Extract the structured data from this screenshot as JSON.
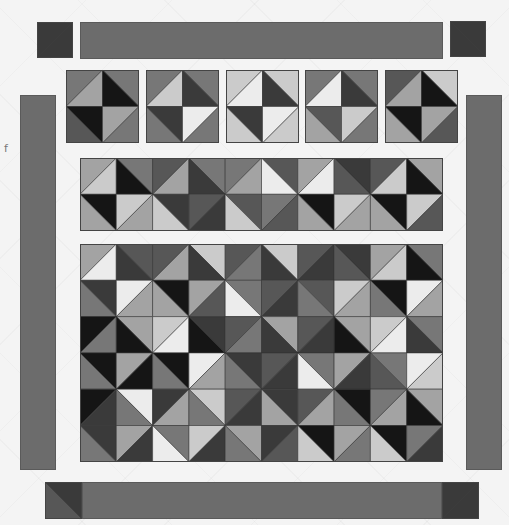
{
  "fragment_text": "f",
  "palette": [
    "#151515",
    "#3a3a3a",
    "#575757",
    "#777777",
    "#a3a3a3",
    "#cbcbcb",
    "#ececec"
  ],
  "border_color": "#6c6c6c",
  "corners": {
    "top_left": {
      "x": 37,
      "y": 22,
      "size": 36,
      "diag": "/",
      "a": 1,
      "b": 1
    },
    "top_right": {
      "x": 450,
      "y": 21,
      "size": 36,
      "diag": "\\",
      "a": 1,
      "b": 1
    },
    "bottom_left": {
      "x": 45,
      "y": 482,
      "size": 37,
      "diag": "\\",
      "a": 1,
      "b": 2
    },
    "bottom_right": {
      "x": 442,
      "y": 482,
      "size": 37,
      "diag": "/",
      "a": 1,
      "b": 1
    }
  },
  "borders": {
    "top": {
      "x": 80,
      "y": 22,
      "w": 363,
      "h": 37
    },
    "bottom": {
      "x": 82,
      "y": 482,
      "w": 360,
      "h": 37
    },
    "left": {
      "x": 20,
      "y": 95,
      "w": 36,
      "h": 375
    },
    "right": {
      "x": 466,
      "y": 95,
      "w": 36,
      "h": 375
    }
  },
  "top_blocks": {
    "y": 70,
    "size": 73,
    "xs": [
      66,
      146,
      226,
      305,
      385
    ],
    "blocks": [
      [
        [
          [
            "/",
            3,
            4
          ],
          [
            "\\",
            3,
            0
          ]
        ],
        [
          [
            "\\",
            0,
            2
          ],
          [
            "/",
            4,
            3
          ]
        ]
      ],
      [
        [
          [
            "/",
            3,
            5
          ],
          [
            "\\",
            3,
            1
          ]
        ],
        [
          [
            "\\",
            1,
            3
          ],
          [
            "/",
            6,
            3
          ]
        ]
      ],
      [
        [
          [
            "/",
            5,
            6
          ],
          [
            "\\",
            5,
            1
          ]
        ],
        [
          [
            "\\",
            1,
            5
          ],
          [
            "/",
            6,
            5
          ]
        ]
      ],
      [
        [
          [
            "/",
            3,
            6
          ],
          [
            "\\",
            3,
            1
          ]
        ],
        [
          [
            "\\",
            2,
            4
          ],
          [
            "/",
            5,
            3
          ]
        ]
      ],
      [
        [
          [
            "/",
            2,
            4
          ],
          [
            "\\",
            5,
            0
          ]
        ],
        [
          [
            "\\",
            0,
            4
          ],
          [
            "/",
            4,
            2
          ]
        ]
      ]
    ]
  },
  "middle_strip": {
    "x": 80,
    "y": 158,
    "cell": 36.3,
    "cols": 10,
    "rows": 2,
    "cells": [
      [
        [
          "/",
          4,
          5
        ],
        [
          "\\",
          3,
          0
        ],
        [
          "/",
          2,
          4
        ],
        [
          "\\",
          3,
          1
        ],
        [
          "/",
          3,
          4
        ],
        [
          "\\",
          2,
          6
        ],
        [
          "/",
          4,
          6
        ],
        [
          "\\",
          1,
          2
        ],
        [
          "/",
          2,
          5
        ],
        [
          "\\",
          4,
          0
        ]
      ],
      [
        [
          "\\",
          0,
          4
        ],
        [
          "/",
          5,
          4
        ],
        [
          "\\",
          1,
          5
        ],
        [
          "/",
          2,
          1
        ],
        [
          "\\",
          2,
          5
        ],
        [
          "/",
          3,
          2
        ],
        [
          "\\",
          0,
          4
        ],
        [
          "/",
          5,
          4
        ],
        [
          "\\",
          0,
          4
        ],
        [
          "/",
          5,
          2
        ]
      ]
    ]
  },
  "main_grid": {
    "x": 80,
    "y": 244,
    "cell": 36.3,
    "cols": 10,
    "rows": 6,
    "cells": [
      [
        [
          "/",
          4,
          6
        ],
        [
          "\\",
          2,
          1
        ],
        [
          "/",
          2,
          4
        ],
        [
          "\\",
          5,
          1
        ],
        [
          "/",
          2,
          3
        ],
        [
          "\\",
          5,
          1
        ],
        [
          "/",
          2,
          1
        ],
        [
          "\\",
          1,
          2
        ],
        [
          "/",
          4,
          5
        ],
        [
          "\\",
          3,
          0
        ]
      ],
      [
        [
          "\\",
          1,
          3
        ],
        [
          "/",
          6,
          4
        ],
        [
          "\\",
          0,
          4
        ],
        [
          "/",
          4,
          2
        ],
        [
          "\\",
          3,
          6
        ],
        [
          "/",
          2,
          1
        ],
        [
          "\\",
          2,
          3
        ],
        [
          "/",
          5,
          4
        ],
        [
          "\\",
          0,
          3
        ],
        [
          "/",
          6,
          4
        ]
      ],
      [
        [
          "/",
          0,
          3
        ],
        [
          "\\",
          4,
          0
        ],
        [
          "/",
          5,
          6
        ],
        [
          "\\",
          1,
          0
        ],
        [
          "/",
          2,
          3
        ],
        [
          "\\",
          4,
          1
        ],
        [
          "/",
          2,
          1
        ],
        [
          "\\",
          4,
          0
        ],
        [
          "/",
          5,
          6
        ],
        [
          "\\",
          3,
          1
        ]
      ],
      [
        [
          "\\",
          0,
          3
        ],
        [
          "/",
          4,
          0
        ],
        [
          "\\",
          0,
          3
        ],
        [
          "/",
          6,
          4
        ],
        [
          "\\",
          1,
          3
        ],
        [
          "/",
          2,
          1
        ],
        [
          "\\",
          3,
          6
        ],
        [
          "/",
          4,
          1
        ],
        [
          "\\",
          3,
          2
        ],
        [
          "/",
          6,
          5
        ]
      ],
      [
        [
          "/",
          0,
          1
        ],
        [
          "\\",
          6,
          3
        ],
        [
          "/",
          1,
          4
        ],
        [
          "\\",
          5,
          3
        ],
        [
          "/",
          2,
          1
        ],
        [
          "\\",
          1,
          4
        ],
        [
          "/",
          2,
          4
        ],
        [
          "\\",
          0,
          3
        ],
        [
          "/",
          3,
          4
        ],
        [
          "\\",
          4,
          0
        ]
      ],
      [
        [
          "\\",
          1,
          3
        ],
        [
          "/",
          4,
          1
        ],
        [
          "\\",
          3,
          6
        ],
        [
          "/",
          5,
          1
        ],
        [
          "\\",
          4,
          3
        ],
        [
          "/",
          1,
          2
        ],
        [
          "\\",
          0,
          5
        ],
        [
          "/",
          4,
          3
        ],
        [
          "\\",
          0,
          5
        ],
        [
          "/",
          3,
          1
        ]
      ]
    ]
  }
}
